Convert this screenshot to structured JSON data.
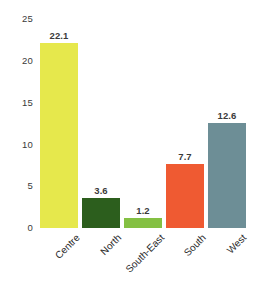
{
  "chart_data": {
    "type": "bar",
    "title": "",
    "subtitle": "",
    "xlabel": "",
    "ylabel": "",
    "categories": [
      "Centre",
      "North",
      "South-East",
      "South",
      "West"
    ],
    "values": [
      22.1,
      3.6,
      1.2,
      7.7,
      12.6
    ],
    "value_labels": [
      "22.1",
      "3.6",
      "1.2",
      "7.7",
      "12.6"
    ],
    "bar_colors": [
      "#e6e84c",
      "#2c5e1d",
      "#84c043",
      "#ef5a32",
      "#6d8e96"
    ],
    "ylim": [
      0,
      25
    ],
    "yticks": [
      0,
      5,
      10,
      15,
      20,
      25
    ],
    "ytick_labels": [
      "0",
      "5",
      "10",
      "15",
      "20",
      "25"
    ],
    "grid": false,
    "legend": false,
    "legend_position": "none",
    "xtick_rotation": -45,
    "background_color": "#ffffff",
    "axis_text_color": "#3a3a3a"
  },
  "axis": {
    "y_ticks": [
      {
        "label": "25",
        "value": 25
      },
      {
        "label": "20",
        "value": 20
      },
      {
        "label": "15",
        "value": 15
      },
      {
        "label": "10",
        "value": 10
      },
      {
        "label": "5",
        "value": 5
      },
      {
        "label": "0",
        "value": 0
      }
    ]
  },
  "bars": [
    {
      "category": "Centre",
      "value": 22.1,
      "label": "22.1",
      "color": "#e6e84c"
    },
    {
      "category": "North",
      "value": 3.6,
      "label": "3.6",
      "color": "#2c5e1d"
    },
    {
      "category": "South-East",
      "value": 1.2,
      "label": "1.2",
      "color": "#84c043"
    },
    {
      "category": "South",
      "value": 7.7,
      "label": "7.7",
      "color": "#ef5a32"
    },
    {
      "category": "West",
      "value": 12.6,
      "label": "12.6",
      "color": "#6d8e96"
    }
  ]
}
